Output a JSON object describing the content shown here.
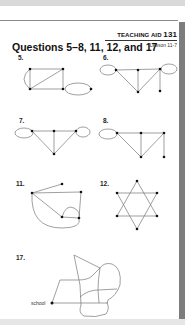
{
  "header": {
    "aid_label": "TEACHING AID",
    "aid_number": "131",
    "lesson": "Lesson 11-7"
  },
  "title": "Questions 5–8, 11, 12, and 17",
  "questions": [
    {
      "number": "5.",
      "type": "graph"
    },
    {
      "number": "6.",
      "type": "graph"
    },
    {
      "number": "7.",
      "type": "graph"
    },
    {
      "number": "8.",
      "type": "graph"
    },
    {
      "number": "11.",
      "type": "graph"
    },
    {
      "number": "12.",
      "type": "graph"
    },
    {
      "number": "17.",
      "type": "map",
      "point_label": "school"
    }
  ],
  "colors": {
    "edge": "#777777",
    "vertex": "#111111",
    "shadow": "#7d7d7d"
  }
}
